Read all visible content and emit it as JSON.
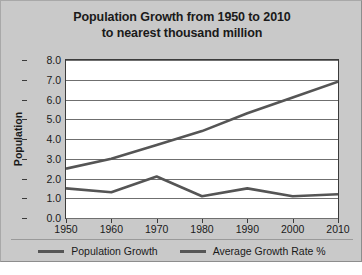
{
  "chart_data": {
    "type": "line",
    "title": "Population Growth from 1950 to 2010",
    "subtitle": "to nearest thousand million",
    "xlabel": "",
    "ylabel": "Population",
    "x": [
      1950,
      1960,
      1970,
      1980,
      1990,
      2000,
      2010
    ],
    "categories": [
      "1950",
      "1960",
      "1970",
      "1980",
      "1990",
      "2000",
      "2010"
    ],
    "series": [
      {
        "name": "Population Growth",
        "values": [
          2.5,
          3.0,
          3.7,
          4.4,
          5.3,
          6.1,
          6.9
        ],
        "color": "#555555"
      },
      {
        "name": "Average Growth Rate %",
        "values": [
          1.5,
          1.3,
          2.1,
          1.1,
          1.5,
          1.1,
          1.2
        ],
        "color": "#555555"
      }
    ],
    "ylim": [
      0.0,
      8.0
    ],
    "ytick_labels": [
      "0.0",
      "1.0",
      "2.0",
      "3.0",
      "4.0",
      "5.0",
      "6.0",
      "7.0",
      "8.0"
    ],
    "ytick_values": [
      0.0,
      1.0,
      2.0,
      3.0,
      4.0,
      5.0,
      6.0,
      7.0,
      8.0
    ],
    "xlim": [
      1950,
      2010
    ],
    "grid": true,
    "legend_position": "bottom"
  },
  "legend": {
    "items": [
      {
        "label": "Population Growth"
      },
      {
        "label": "Average Growth Rate %"
      }
    ]
  },
  "colors": {
    "series_line": "#555555",
    "card_background": "#c9c9c9",
    "plot_background": "#ffffff",
    "gridline": "#6f6f6f",
    "axis": "#3b3b3b",
    "text": "#1a1a1a"
  }
}
